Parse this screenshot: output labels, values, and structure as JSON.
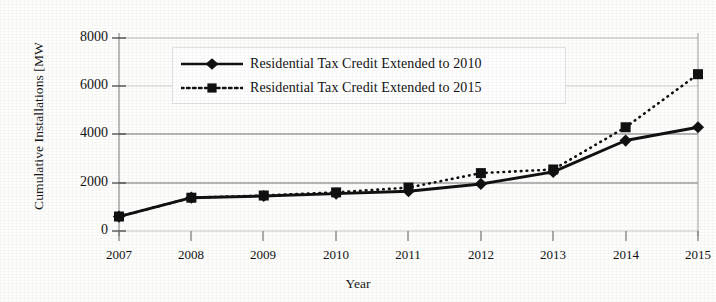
{
  "chart_data": {
    "type": "line",
    "title": "",
    "xlabel": "Year",
    "ylabel": "Cumulative Installations [MW",
    "categories": [
      "2007",
      "2008",
      "2009",
      "2010",
      "2011",
      "2012",
      "2013",
      "2014",
      "2015"
    ],
    "x": [
      2007,
      2008,
      2009,
      2010,
      2011,
      2012,
      2013,
      2014,
      2015
    ],
    "xlim": [
      2007,
      2015
    ],
    "ylim": [
      0,
      8000
    ],
    "yticks": [
      "0",
      "2000",
      "4000",
      "6000",
      "8000"
    ],
    "ytick_values": [
      0,
      2000,
      4000,
      6000,
      8000
    ],
    "xticks": [
      "2007",
      "2008",
      "2009",
      "2010",
      "2011",
      "2012",
      "2013",
      "2014",
      "2015"
    ],
    "grid": "horizontal",
    "legend_position": "top-center",
    "series": [
      {
        "name": "Residential Tax Credit Extended to 2010",
        "values": [
          600,
          1380,
          1450,
          1550,
          1650,
          1950,
          2450,
          3750,
          4300
        ],
        "marker": "diamond",
        "line_style": "solid",
        "color": "#111111"
      },
      {
        "name": "Residential Tax Credit Extended to 2015",
        "values": [
          600,
          1380,
          1470,
          1600,
          1800,
          2400,
          2550,
          4300,
          6500
        ],
        "marker": "square",
        "line_style": "dotted",
        "color": "#111111"
      }
    ]
  },
  "legend": {
    "entries": [
      {
        "label": "Residential Tax Credit Extended to 2010"
      },
      {
        "label": "Residential Tax Credit Extended to 2015"
      }
    ]
  },
  "axes": {
    "y_title": "Cumulative Installations [MW",
    "x_title": "Year",
    "y_tick_labels": [
      "8000",
      "6000",
      "4000",
      "2000",
      "0"
    ],
    "x_tick_labels": [
      "2007",
      "2008",
      "2009",
      "2010",
      "2011",
      "2012",
      "2013",
      "2014",
      "2015"
    ]
  },
  "colors": {
    "ink": "#111111",
    "gridline": "#9a9a9a",
    "axis": "#9d9d9d",
    "paper": "#fdfdfc"
  }
}
